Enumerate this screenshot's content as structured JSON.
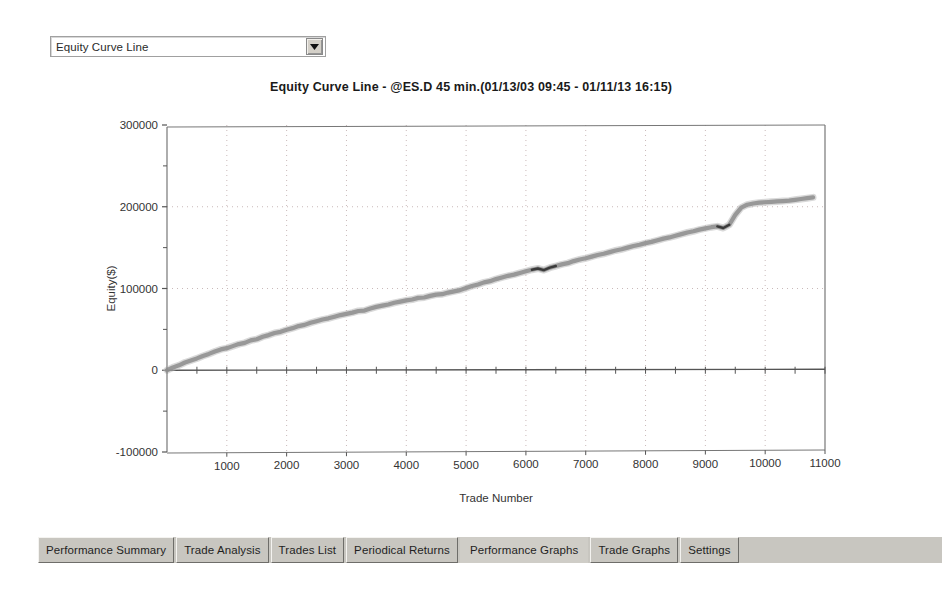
{
  "graph_selector": {
    "selected": "Equity Curve Line",
    "arrow_icon": "chevron-down-icon"
  },
  "chart_data": {
    "type": "line",
    "title": "Equity Curve Line - @ES.D 45 min.(01/13/03 09:45 - 01/11/13 16:15)",
    "xlabel": "Trade Number",
    "ylabel": "Equity($)",
    "xlim": [
      0,
      11000
    ],
    "ylim": [
      -100000,
      300000
    ],
    "xticks": [
      1000,
      2000,
      3000,
      4000,
      5000,
      6000,
      7000,
      8000,
      9000,
      10000,
      11000
    ],
    "xtick_labels": [
      "1000",
      "2000",
      "3000",
      "4000",
      "5000",
      "6000",
      "7000",
      "8000",
      "9000",
      "10000",
      "11000"
    ],
    "yticks": [
      -100000,
      0,
      100000,
      200000,
      300000
    ],
    "ytick_labels": [
      "-100000",
      "0",
      "100000",
      "200000",
      "300000"
    ],
    "yminor_ticks": [
      -50000,
      50000,
      150000,
      250000
    ],
    "grid": true,
    "grid_style": "dotted",
    "legend": null,
    "zero_line": 0,
    "series": [
      {
        "name": "Equity Curve Line",
        "color": "#8c8c8c",
        "x": [
          0,
          100,
          200,
          300,
          400,
          500,
          600,
          700,
          800,
          900,
          1000,
          1100,
          1200,
          1300,
          1400,
          1500,
          1600,
          1700,
          1800,
          1900,
          2000,
          2100,
          2200,
          2300,
          2400,
          2500,
          2600,
          2700,
          2800,
          2900,
          3000,
          3100,
          3200,
          3300,
          3400,
          3500,
          3600,
          3700,
          3800,
          3900,
          4000,
          4100,
          4200,
          4300,
          4400,
          4500,
          4600,
          4700,
          4800,
          4900,
          5000,
          5100,
          5200,
          5300,
          5400,
          5500,
          5600,
          5700,
          5800,
          5900,
          6000,
          6100,
          6200,
          6300,
          6400,
          6500,
          6600,
          6700,
          6800,
          6900,
          7000,
          7100,
          7200,
          7300,
          7400,
          7500,
          7600,
          7700,
          7800,
          7900,
          8000,
          8100,
          8200,
          8300,
          8400,
          8500,
          8600,
          8700,
          8800,
          8900,
          9000,
          9100,
          9200,
          9300,
          9400,
          9500,
          9600,
          9700,
          9800,
          9900,
          10000,
          10100,
          10200,
          10300,
          10400,
          10500,
          10600,
          10700,
          10800
        ],
        "y": [
          0,
          3500,
          6000,
          9500,
          12000,
          14500,
          17500,
          20000,
          23000,
          25500,
          27000,
          29500,
          32000,
          33500,
          36500,
          38000,
          41000,
          43000,
          45500,
          47000,
          49500,
          51500,
          54000,
          55500,
          58000,
          60000,
          62000,
          63500,
          65500,
          67500,
          69000,
          70500,
          72500,
          73000,
          75500,
          77500,
          79000,
          80500,
          82500,
          84000,
          85500,
          86500,
          88500,
          89000,
          91000,
          92500,
          93000,
          95000,
          96500,
          98000,
          100500,
          103000,
          105000,
          107500,
          109000,
          111500,
          113500,
          115500,
          117000,
          119000,
          121000,
          123000,
          124500,
          122500,
          125500,
          127500,
          129500,
          131000,
          133500,
          135500,
          137000,
          139000,
          141000,
          142500,
          144500,
          146500,
          148000,
          150000,
          152000,
          153500,
          155500,
          157000,
          159000,
          161000,
          162500,
          164500,
          166500,
          168500,
          170000,
          172000,
          173500,
          175000,
          176000,
          174000,
          178000,
          190000,
          199000,
          202500,
          204000,
          205000,
          205500,
          206000,
          206500,
          207000,
          207500,
          208500,
          209500,
          210500,
          211500
        ]
      }
    ],
    "drawdown_segments": [
      {
        "x_start": 6100,
        "x_end": 6500,
        "note": "dark drawdown segment"
      },
      {
        "x_start": 9200,
        "x_end": 9400,
        "note": "dark drawdown segment"
      }
    ]
  },
  "tabs": [
    {
      "label": "Performance Summary",
      "active": false
    },
    {
      "label": "Trade Analysis",
      "active": false
    },
    {
      "label": "Trades List",
      "active": false
    },
    {
      "label": "Periodical Returns",
      "active": false
    },
    {
      "label": "Performance Graphs",
      "active": true
    },
    {
      "label": "Trade Graphs",
      "active": false
    },
    {
      "label": "Settings",
      "active": false
    }
  ]
}
